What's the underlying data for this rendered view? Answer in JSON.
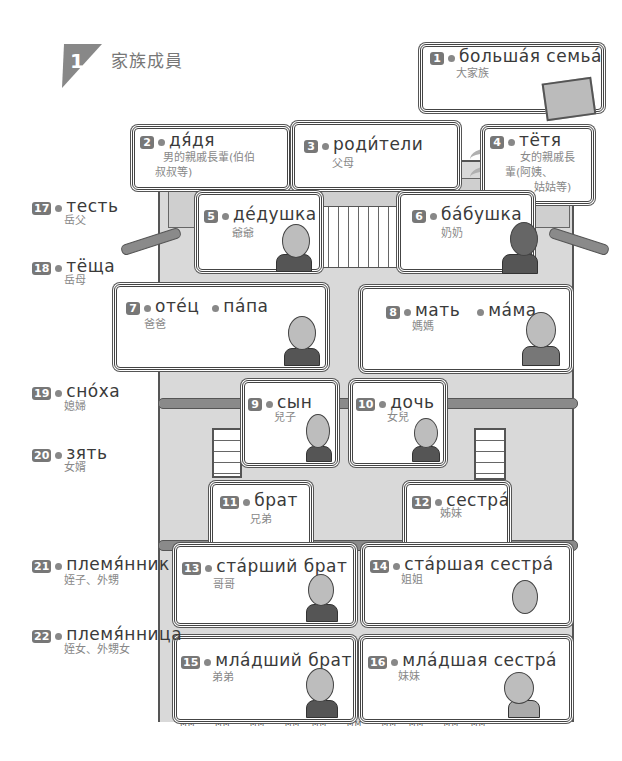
{
  "section": {
    "number": "1",
    "title": "家族成員"
  },
  "entries": [
    {
      "num": "1",
      "ru": "большáя  семьá",
      "zh": "大家族"
    },
    {
      "num": "2",
      "ru": "дя́дя",
      "zh": "男的親戚長輩(伯伯叔叔等)",
      "zh_lines": [
        "男的親戚長輩(伯伯",
        "叔叔等)"
      ]
    },
    {
      "num": "3",
      "ru": "роди́тели",
      "zh": "父母"
    },
    {
      "num": "4",
      "ru": "тётя",
      "zh": "女的親戚長輩(阿姨、姑姑等)",
      "zh_lines": [
        "女的親戚長",
        "輩(阿姨、",
        "姑姑等)"
      ]
    },
    {
      "num": "5",
      "ru": "дéдушка",
      "zh": "爺爺"
    },
    {
      "num": "6",
      "ru": "бáбушка",
      "zh": "奶奶"
    },
    {
      "num": "7",
      "ru": "отéц",
      "ru2": "пáпа",
      "zh": "爸爸"
    },
    {
      "num": "8",
      "ru": "мать",
      "ru2": "мáма",
      "zh": "媽媽"
    },
    {
      "num": "9",
      "ru": "сын",
      "zh": "兒子"
    },
    {
      "num": "10",
      "ru": "дочь",
      "zh": "女兒"
    },
    {
      "num": "11",
      "ru": "брат",
      "zh": "兄弟"
    },
    {
      "num": "12",
      "ru": "сестрá",
      "zh": "姊妹"
    },
    {
      "num": "13",
      "ru": "стáрший  брат",
      "zh": "哥哥"
    },
    {
      "num": "14",
      "ru": "стáршая  сестрá",
      "zh": "姐姐"
    },
    {
      "num": "15",
      "ru": "млáдший  брат",
      "zh": "弟弟"
    },
    {
      "num": "16",
      "ru": "млáдшая  сестрá",
      "zh": "妹妹"
    },
    {
      "num": "17",
      "ru": "тесть",
      "zh": "岳父"
    },
    {
      "num": "18",
      "ru": "тёща",
      "zh": "岳母"
    },
    {
      "num": "19",
      "ru": "снóха",
      "zh": "媳婦"
    },
    {
      "num": "20",
      "ru": "зять",
      "zh": "女婿"
    },
    {
      "num": "21",
      "ru": "племя́нник",
      "zh": "姪子、外甥"
    },
    {
      "num": "22",
      "ru": "племя́нница",
      "zh": "姪女、外甥女"
    }
  ],
  "colors": {
    "badge_bg": "#777777",
    "dot": "#888888",
    "house_wall": "#d9d9d9",
    "text_russian": "#3a3a3a",
    "text_chinese": "#888888"
  }
}
